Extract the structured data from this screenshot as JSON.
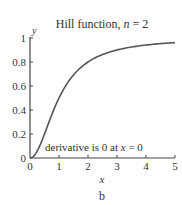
{
  "chart_data": {
    "type": "line",
    "title": "Hill function, n = 2",
    "title_prefix": "Hill function, ",
    "title_var": "n",
    "title_suffix": " = 2",
    "xlabel": "x",
    "ylabel": "y",
    "xlim": [
      0,
      5
    ],
    "ylim": [
      0,
      1
    ],
    "xticks": [
      "0",
      "1",
      "2",
      "3",
      "4",
      "5"
    ],
    "yticks": [
      "0",
      "0.2",
      "0.4",
      "0.6",
      "0.8",
      "1"
    ],
    "grid": false,
    "legend": null,
    "annotation": "derivative is 0 at x = 0",
    "annotation_prefix": "derivative is 0 at ",
    "annotation_var": "x",
    "annotation_suffix": " = 0",
    "caption": "b",
    "series": [
      {
        "name": "x^2/(1+x^2)",
        "x": [
          0,
          0.25,
          0.5,
          0.75,
          1,
          1.5,
          2,
          2.5,
          3,
          3.5,
          4,
          4.5,
          5
        ],
        "values": [
          0,
          0.059,
          0.2,
          0.36,
          0.5,
          0.692,
          0.8,
          0.862,
          0.9,
          0.925,
          0.941,
          0.953,
          0.962
        ]
      }
    ]
  }
}
